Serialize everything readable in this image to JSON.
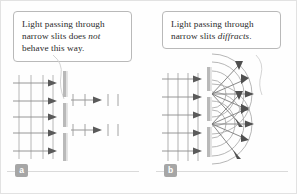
{
  "figure": {
    "background_color": "#fefefe",
    "border_color": "#e2e2e2",
    "ink_color": "#6f6f6f",
    "arrow_color": "#5a5a5a",
    "barrier_color": "#b5b5b5",
    "wave_color": "#8f8f8f"
  },
  "panels": [
    {
      "key": "a",
      "badge_label": "a",
      "caption_line1": "Light passing through",
      "caption_line2_pre": "narrow slits does ",
      "caption_line2_em": "not",
      "caption_line3": "behave this way.",
      "caption_plain": "Light passing through narrow slits does not behave this way.",
      "behavior": "straight-through beams, no spreading",
      "incoming_wavefronts": 4,
      "incoming_arrows": 5,
      "slits": 2,
      "outgoing_beams": 2,
      "outgoing_wavefronts_per_beam": 3
    },
    {
      "key": "b",
      "badge_label": "b",
      "caption_line1": "Light passing through",
      "caption_line2_pre": "narrow slits ",
      "caption_line2_em": "diffracts",
      "caption_line3": ".",
      "caption_plain": "Light passing through narrow slits diffracts.",
      "behavior": "circular wavefronts spreading from each slit",
      "incoming_wavefronts": 4,
      "incoming_arrows": 5,
      "slits": 2,
      "arcs_per_slit": 4,
      "radiating_arrows_per_slit": 5
    }
  ]
}
